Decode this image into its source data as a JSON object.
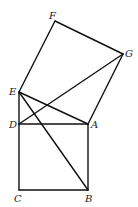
{
  "diagram": {
    "type": "geometry",
    "points": {
      "A": {
        "x": 88,
        "y": 124,
        "label": "A"
      },
      "B": {
        "x": 88,
        "y": 190,
        "label": "B"
      },
      "C": {
        "x": 19,
        "y": 190,
        "label": "C"
      },
      "D": {
        "x": 19,
        "y": 124,
        "label": "D"
      },
      "E": {
        "x": 19,
        "y": 92,
        "label": "E"
      },
      "F": {
        "x": 55,
        "y": 21,
        "label": "F"
      },
      "G": {
        "x": 123,
        "y": 54,
        "label": "G"
      }
    },
    "segments": [
      [
        "C",
        "B"
      ],
      [
        "B",
        "A"
      ],
      [
        "A",
        "D"
      ],
      [
        "D",
        "C"
      ],
      [
        "D",
        "E"
      ],
      [
        "E",
        "F"
      ],
      [
        "F",
        "G"
      ],
      [
        "G",
        "A"
      ],
      [
        "A",
        "E"
      ],
      [
        "E",
        "B"
      ],
      [
        "D",
        "G"
      ]
    ],
    "labels": {
      "A": "A",
      "B": "B",
      "C": "C",
      "D": "D",
      "E": "E",
      "F": "F",
      "G": "G"
    }
  }
}
